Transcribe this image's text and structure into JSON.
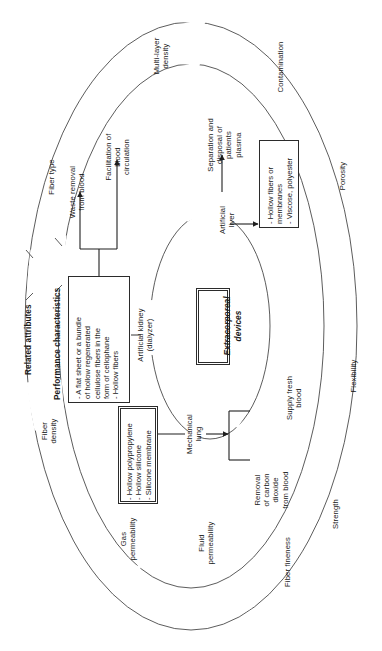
{
  "diagram": {
    "orientation": "rotated-90-ccw",
    "center": {
      "label": "Extracorporeal\ndevices"
    },
    "column_headers": [
      {
        "id": "related-attributes",
        "label": "Related attributes"
      },
      {
        "id": "performance-characteristics",
        "label": "Performance characteristics"
      }
    ],
    "devices": [
      {
        "id": "artificial-kidney",
        "label": "Artificial kidney\n(dialyzer)"
      },
      {
        "id": "artificial-liver",
        "label": "Artificial\nliver"
      },
      {
        "id": "mechanical-lung",
        "label": "Mechanical\nlung"
      }
    ],
    "material_boxes": [
      {
        "id": "kidney-materials",
        "lines": [
          "- A flat sheet or a bundle",
          "of hollow regenerated",
          "cellulose fibers in the",
          "form of cellophane",
          "- Hollow fibers"
        ]
      },
      {
        "id": "lung-materials",
        "lines": [
          "- Hollow polypropylene",
          "- Hollow silicone",
          "- Silicone membrane"
        ]
      },
      {
        "id": "liver-materials",
        "lines": [
          "- Hollow fibers or",
          "membranes",
          "- Viscose, polyester"
        ]
      }
    ],
    "functions": [
      {
        "id": "waste-removal",
        "label": "Waste removal\nfrom blood"
      },
      {
        "id": "facilitation-blood-circulation",
        "label": "Facilitation of\nblood\ncirculation"
      },
      {
        "id": "separation-disposal-plasma",
        "label": "Separation and\ndisposal of\npatients\nplasma"
      },
      {
        "id": "supply-fresh-blood",
        "label": "Supply fresh\nblood"
      },
      {
        "id": "removal-carbon-dioxide",
        "label": "Removal\nof carbon\ndioxide\nfrom blood"
      }
    ],
    "attributes": [
      {
        "id": "fiber-type",
        "label": "Fiber type"
      },
      {
        "id": "multi-layer-density",
        "label": "Multi-layer\ndensity"
      },
      {
        "id": "contamination",
        "label": "Contamination"
      },
      {
        "id": "porosity",
        "label": "Porosity"
      },
      {
        "id": "flexibility",
        "label": "Flexibility"
      },
      {
        "id": "strength",
        "label": "Strength"
      },
      {
        "id": "fiber-fineness",
        "label": "Fiber fineness"
      },
      {
        "id": "fluid-permeability",
        "label": "Fluid\npermeability"
      },
      {
        "id": "gas-permeability",
        "label": "Gas\npermeability"
      },
      {
        "id": "fiber-density",
        "label": "Fiber\ndensity"
      }
    ]
  }
}
